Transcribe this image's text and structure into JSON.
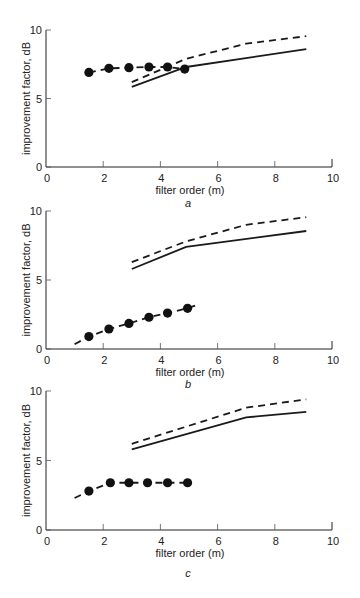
{
  "chart_data": [
    {
      "type": "line",
      "panel_label": "a",
      "xlabel": "filter order (m)",
      "ylabel": "improvement factor, dB",
      "xlim": [
        0,
        10
      ],
      "ylim": [
        0,
        10
      ],
      "xticks": [
        0,
        2,
        4,
        6,
        8,
        10
      ],
      "yticks": [
        0,
        5,
        10
      ],
      "grid": false,
      "series": [
        {
          "name": "dashed",
          "style": "dashed",
          "x": [
            3.0,
            4.9,
            7.0,
            9.1
          ],
          "y": [
            6.2,
            7.9,
            9.0,
            9.55
          ]
        },
        {
          "name": "solid",
          "style": "solid",
          "x": [
            3.0,
            4.9,
            9.1
          ],
          "y": [
            5.85,
            7.3,
            8.6
          ]
        },
        {
          "name": "measured",
          "style": "dashed-markers",
          "x": [
            1.5,
            2.2,
            2.9,
            3.6,
            4.25,
            4.85
          ],
          "y": [
            6.9,
            7.2,
            7.25,
            7.3,
            7.3,
            7.15
          ]
        }
      ]
    },
    {
      "type": "line",
      "panel_label": "b",
      "xlabel": "filter order (m)",
      "ylabel": "improvement factor, dB",
      "xlim": [
        0,
        10
      ],
      "ylim": [
        0,
        10
      ],
      "xticks": [
        0,
        2,
        4,
        6,
        8,
        10
      ],
      "yticks": [
        0,
        5,
        10
      ],
      "grid": false,
      "series": [
        {
          "name": "dashed",
          "style": "dashed",
          "x": [
            3.0,
            4.9,
            7.0,
            9.1
          ],
          "y": [
            6.3,
            7.8,
            9.0,
            9.55
          ]
        },
        {
          "name": "solid",
          "style": "solid",
          "x": [
            3.0,
            4.9,
            9.1
          ],
          "y": [
            5.8,
            7.4,
            8.55
          ]
        },
        {
          "name": "measured",
          "style": "dashed-markers",
          "x": [
            1.5,
            2.2,
            2.9,
            3.6,
            4.25,
            4.95
          ],
          "y": [
            0.9,
            1.45,
            1.85,
            2.3,
            2.6,
            2.95
          ],
          "line_x": [
            1.0,
            5.35
          ],
          "line_y": [
            0.35,
            3.25
          ]
        }
      ]
    },
    {
      "type": "line",
      "panel_label": "c",
      "xlabel": "filter order (m)",
      "ylabel": "improvement factor, dB",
      "xlim": [
        0,
        10
      ],
      "ylim": [
        0,
        10
      ],
      "xticks": [
        0,
        2,
        4,
        6,
        8,
        10
      ],
      "yticks": [
        0,
        5,
        10
      ],
      "grid": false,
      "series": [
        {
          "name": "dashed",
          "style": "dashed",
          "x": [
            3.0,
            7.0,
            9.1
          ],
          "y": [
            6.2,
            8.8,
            9.4
          ]
        },
        {
          "name": "solid",
          "style": "solid",
          "x": [
            3.0,
            7.0,
            9.1
          ],
          "y": [
            5.8,
            8.1,
            8.5
          ]
        },
        {
          "name": "measured",
          "style": "dashed-markers",
          "x": [
            1.5,
            2.25,
            2.9,
            3.55,
            4.25,
            4.95
          ],
          "y": [
            2.8,
            3.4,
            3.4,
            3.4,
            3.4,
            3.4
          ],
          "line_start": [
            1.0,
            2.3
          ]
        }
      ]
    }
  ],
  "layout_px": {
    "panels": [
      {
        "x0": 46,
        "x1": 332,
        "y0": 167,
        "y10": 30,
        "label_y": 207
      },
      {
        "x0": 46,
        "x1": 332,
        "y0": 349,
        "y10": 211,
        "label_y": 388
      },
      {
        "x0": 46,
        "x1": 332,
        "y0": 530,
        "y10": 391,
        "label_y": 577
      }
    ]
  }
}
